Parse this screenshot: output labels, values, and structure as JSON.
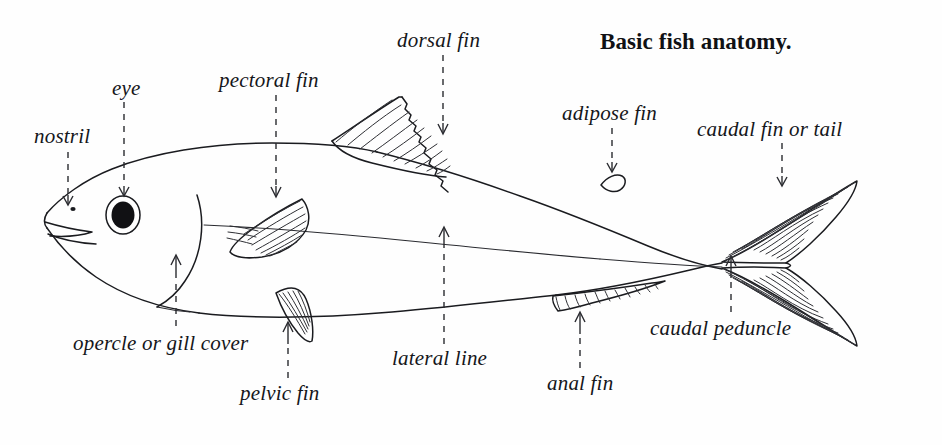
{
  "figure": {
    "title": "Basic fish anatomy.",
    "subject": "fish",
    "style": "line-drawing",
    "ink_color": "#15161a",
    "background_color": "#fefefe",
    "width": 942,
    "height": 445
  },
  "labels": {
    "nostril": "nostril",
    "eye": "eye",
    "pectoral_fin": "pectoral fin",
    "dorsal_fin": "dorsal fin",
    "adipose_fin": "adipose fin",
    "caudal_fin_or_tail": "caudal fin or tail",
    "opercle_or_gill_cover": "opercle or gill cover",
    "pelvic_fin": "pelvic fin",
    "lateral_line": "lateral line",
    "anal_fin": "anal fin",
    "caudal_peduncle": "caudal peduncle"
  }
}
